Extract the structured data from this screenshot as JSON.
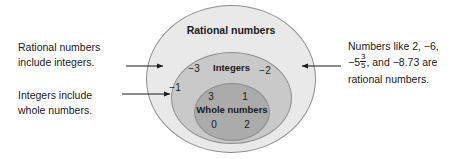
{
  "diagram": {
    "type": "nested-venn",
    "title_visible": false,
    "sets": [
      {
        "id": "rational",
        "label": "Rational numbers",
        "fill": "#e9e9e9",
        "stroke": "#8e8e8e",
        "members": []
      },
      {
        "id": "integers",
        "label": "Integers",
        "fill": "#c9c9c9",
        "stroke": "#8e8e8e",
        "members": [
          "−3",
          "−2",
          "−1"
        ]
      },
      {
        "id": "whole",
        "label": "Whole numbers",
        "fill": "#ababab",
        "stroke": "#8e8e8e",
        "members": [
          "3",
          "1",
          "0",
          "2"
        ]
      }
    ],
    "members": {
      "neg3": "−3",
      "neg2": "−2",
      "neg1": "−1",
      "three": "3",
      "one": "1",
      "zero": "0",
      "two": "2"
    }
  },
  "annotations": {
    "left_top": {
      "line1": "Rational numbers",
      "line2": "include integers.",
      "points_to": "rational"
    },
    "left_bottom": {
      "line1": "Integers include",
      "line2": "whole numbers.",
      "points_to": "integers"
    },
    "right": {
      "line1_a": "Numbers like 2, −6,",
      "line2_a": "−5",
      "fraction_numerator": "3",
      "fraction_denominator": "5",
      "line2_b": ", and −8.73 are",
      "line3": "rational numbers.",
      "points_to": "rational"
    }
  },
  "colors": {
    "background": "#ffffff",
    "text": "#1a1a1a",
    "outer_fill": "#e9e9e9",
    "middle_fill": "#c9c9c9",
    "inner_fill": "#ababab",
    "stroke": "#8e8e8e",
    "arrow": "#1a1a1a"
  }
}
